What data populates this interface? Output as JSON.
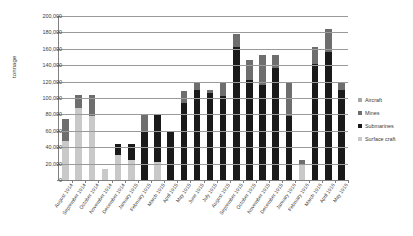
{
  "chart_data": {
    "type": "bar",
    "stacked": true,
    "title": "",
    "xlabel": "",
    "ylabel": "tonnage",
    "ylim": [
      0,
      200000
    ],
    "ytick_step": 20000,
    "ytick_labels": [
      "0",
      "20,000",
      "40,000",
      "60,000",
      "80,000",
      "100,000",
      "120,000",
      "140,000",
      "160,000",
      "180,000",
      "200,000"
    ],
    "ytick_values": [
      0,
      20000,
      40000,
      60000,
      80000,
      100000,
      120000,
      140000,
      160000,
      180000,
      200000
    ],
    "grid": true,
    "legend_position": "right",
    "series_order_bottom_to_top": [
      "Surface craft",
      "Submarines",
      "Mines",
      "Aircraft"
    ],
    "categories": [
      "August 1914",
      "September 1914",
      "October 1914",
      "November 1914",
      "December 1914",
      "January 1915",
      "February 1915",
      "March 1915",
      "April 1915",
      "May 1915",
      "June 1915",
      "July 1915",
      "August 1915",
      "September 1915",
      "October 1915",
      "November 1915",
      "December 1915",
      "January 1916",
      "February 1916",
      "March 1916",
      "April 1916",
      "May 1916"
    ],
    "series": [
      {
        "name": "Surface craft",
        "color": "#c9c9c9",
        "values": [
          48000,
          88000,
          78000,
          14000,
          30000,
          24000,
          0,
          22000,
          0,
          0,
          0,
          0,
          0,
          0,
          0,
          0,
          0,
          0,
          18000,
          0,
          0,
          0
        ]
      },
      {
        "name": "Submarines",
        "color": "#1a1a1a",
        "values": [
          0,
          0,
          0,
          0,
          14000,
          20000,
          60000,
          58000,
          60000,
          94000,
          110000,
          106000,
          102000,
          162000,
          122000,
          116000,
          136000,
          78000,
          0,
          142000,
          156000,
          110000
        ]
      },
      {
        "name": "Mines",
        "color": "#6e6e6e",
        "values": [
          26000,
          16000,
          26000,
          0,
          0,
          0,
          20000,
          0,
          0,
          14000,
          8000,
          4000,
          16000,
          16000,
          24000,
          36000,
          16000,
          40000,
          6000,
          20000,
          28000,
          8000
        ]
      },
      {
        "name": "Aircraft",
        "color": "#a8a8a8",
        "values": [
          0,
          0,
          0,
          0,
          0,
          0,
          0,
          0,
          0,
          0,
          0,
          0,
          0,
          0,
          0,
          0,
          0,
          0,
          0,
          0,
          0,
          0
        ]
      }
    ]
  },
  "legend": {
    "items": [
      {
        "label": "Aircraft",
        "color": "#a8a8a8"
      },
      {
        "label": "Mines",
        "color": "#6e6e6e"
      },
      {
        "label": "Submarines",
        "color": "#1a1a1a"
      },
      {
        "label": "Surface craft",
        "color": "#c9c9c9"
      }
    ]
  }
}
